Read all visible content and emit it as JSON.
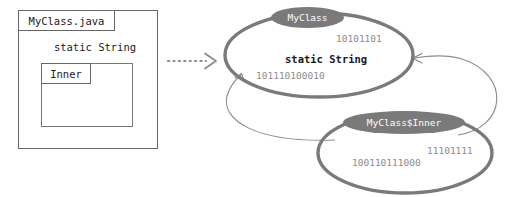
{
  "diagram": {
    "colors": {
      "box_border": "#666666",
      "ellipse_stroke": "#7a7a7a",
      "pill_fill": "#7a7a7a",
      "pill_text": "#ffffff",
      "binary_text": "#8c8c8c",
      "body_text": "#1a1a1a",
      "arrow_stroke": "#8c8c8c",
      "background": "#ffffff"
    }
  },
  "source_panel": {
    "file_label": "MyClass.java",
    "static_field": "static String",
    "inner_label": "Inner"
  },
  "transform_arrow": {
    "icon": "dotted-arrow-right-icon",
    "style": "dotted"
  },
  "runtime": {
    "myclass": {
      "label": "MyClass",
      "static_field": "static String",
      "binary_top": "10101101",
      "binary_bottom": "101110100010"
    },
    "inner": {
      "label": "MyClass$Inner",
      "binary_top": "11101111",
      "binary_bottom": "100110111000"
    },
    "connectors": [
      {
        "icon": "curved-arrow-up-left-icon",
        "from": "inner",
        "to": "myclass"
      },
      {
        "icon": "curved-arrow-left-icon",
        "from": "inner",
        "to": "static-field"
      }
    ]
  }
}
